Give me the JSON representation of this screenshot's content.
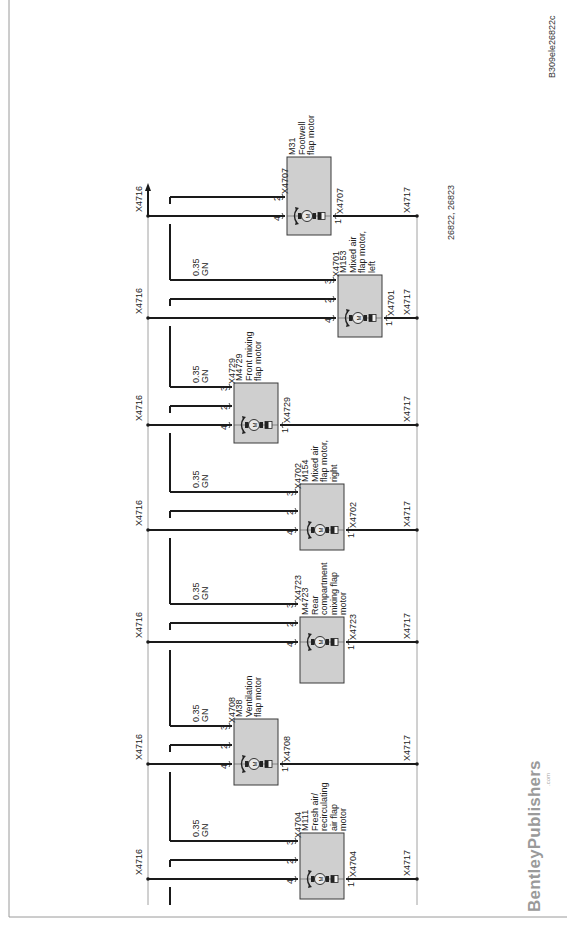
{
  "document": {
    "watermark_id": "B309ele26822c",
    "reference": "26822, 26823",
    "brand": "BentleyPublishers",
    "brand_suffix": ".com"
  },
  "buses": {
    "left": "X4716",
    "right": "X4717"
  },
  "wire_spec": {
    "gauge": "0.35",
    "color": "GN"
  },
  "motors": [
    {
      "id": "M31",
      "name_lines": [
        "M31",
        "Footwell",
        "flap motor"
      ],
      "connector": "X4707",
      "connector_right": "X4707",
      "pins": [
        "2",
        "4",
        "1"
      ],
      "has_pin3": false,
      "y4": 216,
      "box": {
        "x": 287,
        "y": 157,
        "w": 44,
        "h": 78
      },
      "wire_label": false,
      "left_label": "X4716",
      "right_label": "X4717"
    },
    {
      "id": "M153",
      "name_lines": [
        "M153",
        "Mixed air",
        "flap motor,",
        "left"
      ],
      "connector": "X4701",
      "connector_right": "X4701",
      "pins": [
        "3",
        "2",
        "4",
        "1"
      ],
      "has_pin3": true,
      "y4": 318,
      "box": {
        "x": 338,
        "y": 275,
        "w": 44,
        "h": 62
      },
      "wire_label": true,
      "left_label": "X4716",
      "right_label": "X4717"
    },
    {
      "id": "M4729",
      "name_lines": [
        "M4729",
        "Front mixing",
        "flap motor"
      ],
      "connector": "X4729",
      "connector_right": "X4729",
      "pins": [
        "3",
        "2",
        "4",
        "1"
      ],
      "has_pin3": true,
      "y4": 425,
      "box": {
        "x": 234,
        "y": 383,
        "w": 44,
        "h": 60
      },
      "wire_label": true,
      "left_label": "X4716",
      "right_label": "X4717"
    },
    {
      "id": "M154",
      "name_lines": [
        "M154",
        "Mixed air",
        "flap motor,",
        "right"
      ],
      "connector": "X4702",
      "connector_right": "X4702",
      "pins": [
        "3",
        "2",
        "4",
        "1"
      ],
      "has_pin3": true,
      "y4": 530,
      "box": {
        "x": 300,
        "y": 484,
        "w": 44,
        "h": 66
      },
      "wire_label": true,
      "left_label": "X4716",
      "right_label": "X4717"
    },
    {
      "id": "M4723",
      "name_lines": [
        "M4723",
        "Rear",
        "compartment",
        "mixing flap",
        "motor"
      ],
      "connector": "X4723",
      "connector_right": "X4723",
      "pins": [
        "3",
        "2",
        "4",
        "1"
      ],
      "has_pin3": true,
      "y4": 642,
      "box": {
        "x": 300,
        "y": 617,
        "w": 44,
        "h": 66
      },
      "wire_label": true,
      "left_label": "X4716",
      "right_label": "X4717"
    },
    {
      "id": "M38",
      "name_lines": [
        "M38",
        "Ventilation",
        "flap motor"
      ],
      "connector": "X4708",
      "connector_right": "X4708",
      "pins": [
        "3",
        "2",
        "4",
        "1"
      ],
      "has_pin3": true,
      "y4": 764,
      "box": {
        "x": 234,
        "y": 719,
        "w": 44,
        "h": 66
      },
      "wire_label": true,
      "left_label": "X4716",
      "right_label": "X4717"
    },
    {
      "id": "M111",
      "name_lines": [
        "M111",
        "Fresh air/",
        "recirculating",
        "air flap",
        "motor"
      ],
      "connector": "X4704",
      "connector_right": "X4704",
      "pins": [
        "3",
        "2",
        "4",
        "1"
      ],
      "has_pin3": true,
      "y4": 879,
      "box": {
        "x": 300,
        "y": 833,
        "w": 44,
        "h": 66
      },
      "wire_label": true,
      "left_label": "X4716",
      "right_label": "X4717"
    }
  ],
  "colors": {
    "wire": "#1a1a1a",
    "thin": "#8a8a8a",
    "box_fill": "#cfcfcf",
    "box_stroke": "#3a3a3a",
    "frame": "#9a9a9a"
  }
}
